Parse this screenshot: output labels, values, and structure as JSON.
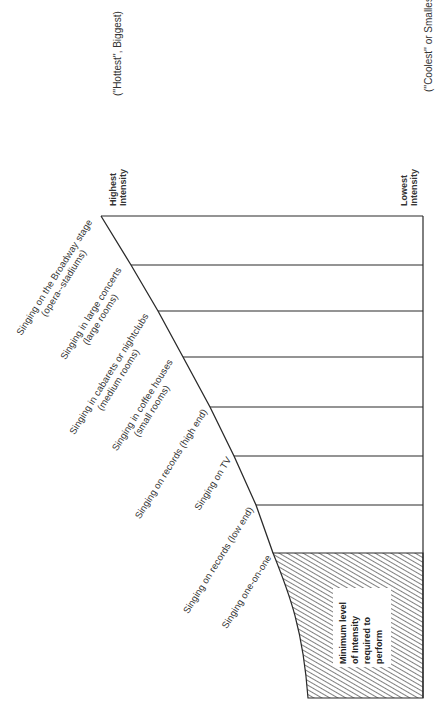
{
  "diagram": {
    "type": "intensity-scale",
    "scale_top": {
      "label": [
        "Highest",
        "Intensity"
      ],
      "note": "(''Hottest'', Biggest)"
    },
    "scale_bottom": {
      "label": [
        "Lowest",
        "Intensity"
      ],
      "note": "(''Coolest'' or Smallest)"
    },
    "levels": [
      {
        "lines": [
          "Singing on the Broadway stage",
          "(opera--stadiums)"
        ]
      },
      {
        "lines": [
          "Singing in large concerts",
          "(large rooms)"
        ]
      },
      {
        "lines": [
          "Singing in cabarets or nightclubs",
          "(medium rooms)"
        ]
      },
      {
        "lines": [
          "Singing in coffee houses",
          "(small rooms)"
        ]
      },
      {
        "lines": [
          "Singing on records (high end)"
        ]
      },
      {
        "lines": [
          "Singing on TV"
        ]
      },
      {
        "lines": [
          "Singing on records (low end)"
        ]
      },
      {
        "lines": [
          "Singing one-on-one"
        ]
      }
    ],
    "minimum_region": {
      "lines": [
        "Minimum level",
        "of Intensity",
        "required to",
        "perform"
      ]
    },
    "colors": {
      "line": "#2a2a2a",
      "hatch": "#3a3a3a",
      "background": "#ffffff"
    }
  }
}
